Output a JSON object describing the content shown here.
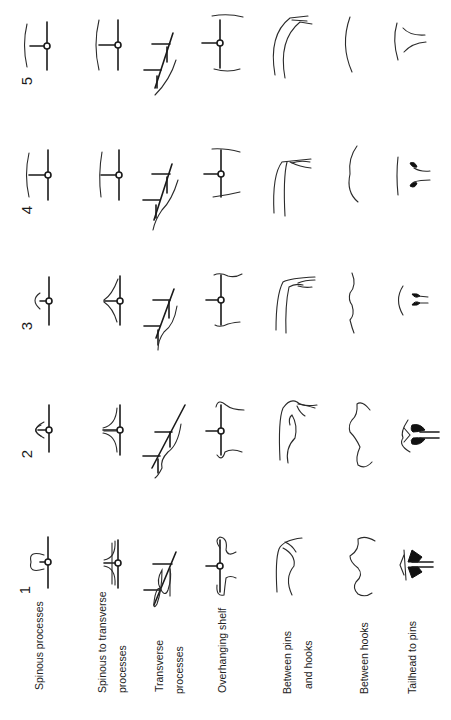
{
  "figure": {
    "orientation": "rotated 90 degrees counter-clockwise",
    "scores": [
      {
        "label": "1",
        "level": "very thin"
      },
      {
        "label": "2",
        "level": "thin"
      },
      {
        "label": "3",
        "level": "average"
      },
      {
        "label": "4",
        "level": "fat"
      },
      {
        "label": "5",
        "level": "very fat"
      }
    ],
    "regions": [
      {
        "label_lines": [
          "Spinous processes"
        ],
        "icon": "spinous-process-profile"
      },
      {
        "label_lines": [
          "Spinous to transverse",
          "processes"
        ],
        "icon": "spinous-to-transverse-profile"
      },
      {
        "label_lines": [
          "Transverse",
          "processes"
        ],
        "icon": "transverse-process-profile"
      },
      {
        "label_lines": [
          "Overhanging shelf"
        ],
        "icon": "overhanging-shelf-profile"
      },
      {
        "label_lines": [
          "Between pins",
          "and hooks"
        ],
        "icon": "pins-hooks-profile"
      },
      {
        "label_lines": [
          "Between hooks"
        ],
        "icon": "between-hooks-profile"
      },
      {
        "label_lines": [
          "Tailhead to pins"
        ],
        "icon": "tailhead-profile"
      }
    ]
  },
  "labels": {
    "spinous": "Spinous processes",
    "sp_trans_1": "Spinous to transverse",
    "sp_trans_2": "processes",
    "trans_1": "Transverse",
    "trans_2": "processes",
    "shelf": "Overhanging shelf",
    "pins_1": "Between pins",
    "pins_2": "and hooks",
    "hooks": "Between hooks",
    "tail": "Tailhead to pins"
  },
  "score_labels": {
    "s1": "1",
    "s2": "2",
    "s3": "3",
    "s4": "4",
    "s5": "5"
  },
  "colors": {
    "ink": "#1a1a1a",
    "background": "#ffffff"
  }
}
